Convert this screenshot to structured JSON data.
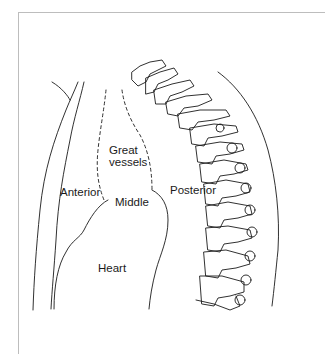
{
  "figure": {
    "labels": {
      "great": "Great",
      "vessels": "vessels",
      "anterior": "Anterior",
      "middle": "Middle",
      "posterior": "Posterior",
      "heart": "Heart"
    },
    "line_color": "#1a1a1a",
    "frame_color": "#bdbdbd"
  }
}
